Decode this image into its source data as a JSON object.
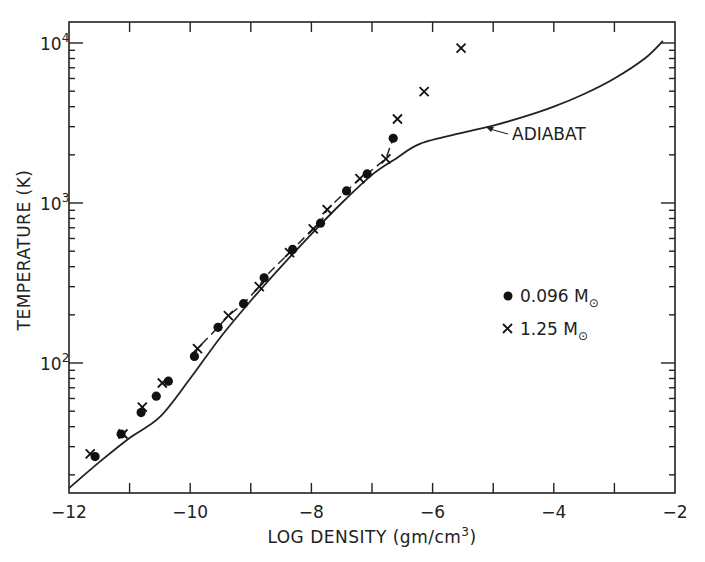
{
  "chart_data": {
    "type": "scatter",
    "title": "",
    "xlabel": "LOG DENSITY (gm/cm3)",
    "ylabel": "TEMPERATURE (K)",
    "xlim": [
      -12,
      -2
    ],
    "ylim": [
      15,
      14000
    ],
    "yscale": "log",
    "x_ticks": [
      -12,
      -10,
      -8,
      -6,
      -4,
      -2
    ],
    "x_tick_labels": [
      "-12",
      "-10",
      "-8",
      "-6",
      "-4",
      "-2"
    ],
    "y_ticks": [
      100,
      1000,
      10000
    ],
    "y_tick_labels": [
      "10^2",
      "10^3",
      "10^4"
    ],
    "grid": false,
    "legend_position": "center-right",
    "annotations": [
      {
        "text": "ADIABAT",
        "points_to": [
          -5.3,
          2900
        ]
      }
    ],
    "series": [
      {
        "name": "0.096 M☉",
        "marker": "filled-circle",
        "x": [
          -11.57,
          -11.14,
          -10.81,
          -10.56,
          -10.36,
          -9.93,
          -9.54,
          -9.12,
          -8.78,
          -8.31,
          -7.85,
          -7.42,
          -7.08,
          -6.65
        ],
        "y": [
          26,
          36,
          49,
          62,
          77,
          110,
          167,
          235,
          341,
          513,
          748,
          1190,
          1520,
          2540
        ]
      },
      {
        "name": "1.25 M☉",
        "marker": "x",
        "x": [
          -11.65,
          -11.11,
          -10.79,
          -10.46,
          -9.88,
          -9.37,
          -8.86,
          -8.36,
          -7.97,
          -7.74,
          -7.2,
          -6.77,
          -6.58,
          -6.14,
          -5.53
        ],
        "y": [
          27,
          36,
          53,
          75,
          123,
          198,
          300,
          490,
          690,
          910,
          1420,
          1890,
          3350,
          4960,
          9300
        ]
      },
      {
        "name": "ADIABAT",
        "marker": "line",
        "x": [
          -12,
          -11.5,
          -11,
          -10.5,
          -10,
          -9.5,
          -9,
          -8.5,
          -8,
          -7.5,
          -7,
          -6.6,
          -6.2,
          -5.5,
          -5,
          -4.5,
          -4,
          -3.5,
          -3,
          -2.5,
          -2.2
        ],
        "y": [
          16.5,
          24,
          34,
          46,
          80,
          145,
          245,
          400,
          640,
          1000,
          1500,
          1900,
          2350,
          2750,
          3050,
          3450,
          4000,
          4800,
          6000,
          8000,
          10300
        ]
      }
    ]
  },
  "axes": {
    "x_title_main": "LOG DENSITY (gm/cm",
    "x_title_sup": "3",
    "x_title_end": ")",
    "y_title": "TEMPERATURE (K)",
    "x_tick_labels": [
      "-12",
      "-10",
      "-8",
      "-6",
      "-4",
      "-2"
    ],
    "y_tick_base": "10",
    "y_tick_exps": [
      "2",
      "3",
      "4"
    ]
  },
  "legend": {
    "items": [
      {
        "label": "0.096 M",
        "sub": "⊙",
        "marker": "dot"
      },
      {
        "label": "1.25 M",
        "sub": "⊙",
        "marker": "cross"
      }
    ]
  },
  "annotation": {
    "label": "ADIABAT"
  }
}
